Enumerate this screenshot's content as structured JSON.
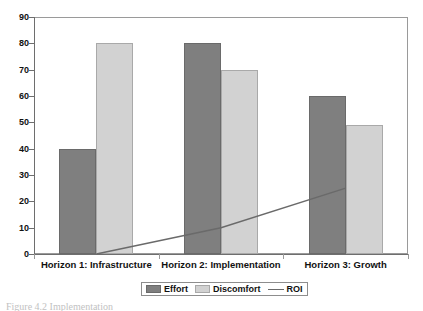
{
  "chart_data": {
    "type": "bar",
    "title": "",
    "xlabel": "",
    "ylabel": "",
    "ylim": [
      0,
      90
    ],
    "ytick_step": 10,
    "yticks": [
      0,
      10,
      20,
      30,
      40,
      50,
      60,
      70,
      80,
      90
    ],
    "grid": false,
    "legend_position": "bottom",
    "categories": [
      "Horizon 1: Infrastructure",
      "Horizon 2: Implementation",
      "Horizon 3: Growth"
    ],
    "series": [
      {
        "name": "Effort",
        "type": "bar",
        "color": "#7f7f7f",
        "values": [
          40,
          80,
          60
        ]
      },
      {
        "name": "Discomfort",
        "type": "bar",
        "color": "#d2d2d2",
        "values": [
          80,
          70,
          49
        ]
      },
      {
        "name": "ROI",
        "type": "line",
        "color": "#6a6a6a",
        "values": [
          0,
          10,
          25
        ]
      }
    ]
  },
  "axis": {
    "y_labels": [
      "90",
      "80",
      "70",
      "60",
      "50",
      "40",
      "30",
      "20",
      "10",
      "0"
    ]
  },
  "legend": {
    "items": [
      {
        "label": "Effort",
        "marker": "swatch-dark"
      },
      {
        "label": "Discomfort",
        "marker": "swatch-light"
      },
      {
        "label": "ROI",
        "marker": "line"
      }
    ]
  },
  "caption": {
    "text": "Figure 4.2  Implementation"
  }
}
